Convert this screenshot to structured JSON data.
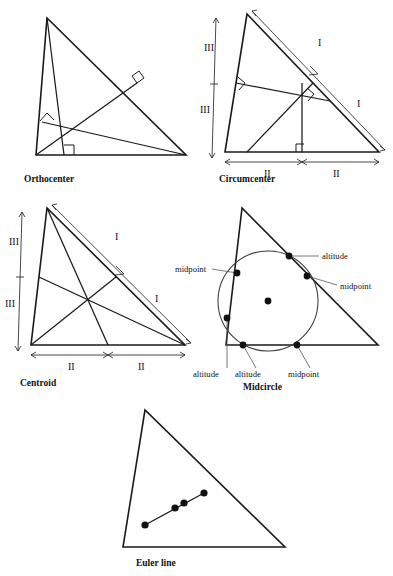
{
  "page": {
    "background": "#ffffff",
    "ink": "#111111"
  },
  "figures": [
    {
      "id": "orthocenter",
      "caption": "Orthocenter",
      "caption_pos": {
        "x": 24,
        "y": 182
      },
      "triangle": {
        "ax": 47,
        "ay": 18,
        "bx": 36,
        "by": 155,
        "cx": 186,
        "cy": 155
      },
      "center": {
        "x": 58,
        "y": 141
      },
      "right_angle_marks": 3,
      "marks": []
    },
    {
      "id": "circumcenter",
      "caption": "Circumcenter",
      "caption_pos": {
        "x": 219,
        "y": 182
      },
      "triangle": {
        "ax": 247,
        "ay": 14,
        "bx": 225,
        "by": 152,
        "cx": 379,
        "cy": 152
      },
      "center": {
        "x": 298,
        "y": 97
      },
      "right_angle_marks": 3,
      "marks": [
        "I",
        "I",
        "II",
        "II",
        "III",
        "III"
      ]
    },
    {
      "id": "centroid",
      "caption": "Centroid",
      "caption_pos": {
        "x": 20,
        "y": 386
      },
      "triangle": {
        "ax": 47,
        "ay": 208,
        "bx": 31,
        "by": 345,
        "cx": 185,
        "cy": 345
      },
      "center": {
        "x": 88,
        "y": 299
      },
      "right_angle_marks": 0,
      "marks": [
        "I",
        "I",
        "II",
        "II",
        "III",
        "III"
      ]
    },
    {
      "id": "midcircle",
      "caption": "Midcircle",
      "caption_pos": {
        "x": 243,
        "y": 386
      },
      "triangle": {
        "ax": 242,
        "ay": 208,
        "bx": 226,
        "by": 345,
        "cx": 378,
        "cy": 345
      },
      "circle": {
        "cx": 268,
        "cy": 301,
        "r": 50
      },
      "center": {
        "x": 268,
        "y": 301
      },
      "right_angle_marks": 0,
      "marks": []
    },
    {
      "id": "euler",
      "caption": "Euler line",
      "caption_pos": {
        "x": 136,
        "y": 566
      },
      "triangle": {
        "ax": 145,
        "ay": 410,
        "bx": 123,
        "by": 547,
        "cx": 285,
        "cy": 547
      },
      "center": {
        "x": 184,
        "y": 503
      },
      "right_angle_marks": 0,
      "marks": []
    }
  ],
  "roman_labels": {
    "one": "I",
    "two": "II",
    "three": "III"
  },
  "circumcenter_marks": [
    {
      "text": "I",
      "x": 318,
      "y": 46
    },
    {
      "text": "I",
      "x": 357,
      "y": 107
    },
    {
      "text": "II",
      "x": 264,
      "y": 177
    },
    {
      "text": "II",
      "x": 333,
      "y": 177
    },
    {
      "text": "III",
      "x": 211,
      "y": 51
    },
    {
      "text": "III",
      "x": 207,
      "y": 113
    }
  ],
  "centroid_marks": [
    {
      "text": "I",
      "x": 115,
      "y": 240
    },
    {
      "text": "I",
      "x": 155,
      "y": 302
    },
    {
      "text": "II",
      "x": 68,
      "y": 370
    },
    {
      "text": "II",
      "x": 138,
      "y": 370
    },
    {
      "text": "III",
      "x": 16,
      "y": 245
    },
    {
      "text": "III",
      "x": 12,
      "y": 307
    }
  ],
  "midcircle_points": [
    {
      "id": "p-altitude-top",
      "label": "altitude",
      "x": 289,
      "y": 256,
      "label_x": 323,
      "label_y": 257,
      "side": "right"
    },
    {
      "id": "p-midpoint-right",
      "label": "midpoint",
      "x": 307,
      "y": 276,
      "label_x": 341,
      "label_y": 288,
      "side": "right"
    },
    {
      "id": "p-midpoint-left",
      "label": "midpoint",
      "x": 237,
      "y": 273,
      "label_x": 198,
      "label_y": 272,
      "side": "left"
    },
    {
      "id": "p-altitude-left",
      "label": "altitude",
      "x": 227,
      "y": 318,
      "label_x": 210,
      "label_y": 377,
      "side": "below"
    },
    {
      "id": "p-altitude-bottom",
      "label": "altitude",
      "x": 243,
      "y": 345,
      "label_x": 245,
      "label_y": 377,
      "side": "below"
    },
    {
      "id": "p-midpoint-bottom",
      "label": "midpoint",
      "x": 297,
      "y": 345,
      "label_x": 300,
      "label_y": 377,
      "side": "below"
    },
    {
      "id": "p-nine-point-center",
      "label": "",
      "x": 268,
      "y": 301,
      "label_x": 0,
      "label_y": 0,
      "side": "none"
    }
  ],
  "euler_points": [
    {
      "x": 145,
      "y": 525
    },
    {
      "x": 175,
      "y": 508
    },
    {
      "x": 184,
      "y": 503
    },
    {
      "x": 204,
      "y": 493
    }
  ]
}
